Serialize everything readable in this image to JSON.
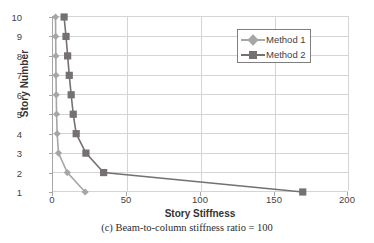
{
  "chart_data": {
    "type": "line",
    "title": "",
    "xlabel": "Story Stiffness",
    "ylabel": "Story Number",
    "xlim": [
      0,
      200
    ],
    "ylim": [
      0,
      10
    ],
    "xticks": [
      "0",
      "50",
      "100",
      "150",
      "200"
    ],
    "yticks": [
      "1",
      "2",
      "3",
      "4",
      "5",
      "6",
      "7",
      "8",
      "9",
      "10"
    ],
    "grid": "horizontal-and-vertical",
    "legend_position": "upper-right",
    "orientation": "story-number-on-y",
    "series": [
      {
        "name": "Method 1",
        "color": "#a6a6a6",
        "marker": "diamond",
        "story_numbers": [
          10,
          9,
          8,
          7,
          6,
          5,
          4,
          3,
          2,
          1
        ],
        "values": [
          2.4,
          2.5,
          2.6,
          2.7,
          2.9,
          3.1,
          3.5,
          4.4,
          10.4,
          22.5
        ]
      },
      {
        "name": "Method 2",
        "color": "#767171",
        "marker": "square",
        "story_numbers": [
          10,
          9,
          8,
          7,
          6,
          5,
          4,
          3,
          2,
          1
        ],
        "values": [
          8.2,
          9.5,
          10.6,
          11.7,
          13.0,
          14.4,
          16.4,
          23.0,
          35.0,
          170.0
        ]
      }
    ]
  },
  "axes": {
    "x_title": "Story Stiffness",
    "y_title": "Story Number",
    "x_ticks": [
      "0",
      "50",
      "100",
      "150",
      "200"
    ],
    "y_ticks": [
      "10",
      "9",
      "8",
      "7",
      "6",
      "5",
      "4",
      "3",
      "2",
      "1"
    ]
  },
  "legend": {
    "entries": [
      {
        "label": "Method 1",
        "color": "#a6a6a6",
        "marker": "diamond-marker"
      },
      {
        "label": "Method 2",
        "color": "#767171",
        "marker": "square-marker"
      }
    ]
  },
  "caption": {
    "text": "(c) Beam-to-column stiffness ratio = 100"
  }
}
